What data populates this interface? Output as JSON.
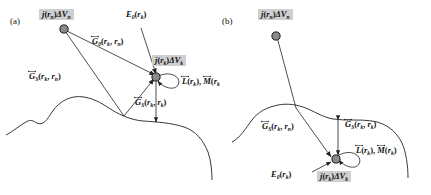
{
  "figure": {
    "type": "two-panel scientific diagram",
    "colors": {
      "stroke": "#222222",
      "node_fill": "#8a8a8a",
      "node_stroke": "#1a1a1a",
      "label_highlight": "#cfcfcf",
      "background": "#ffffff"
    }
  },
  "panel_a": {
    "id": "(a)",
    "labels": {
      "source": {
        "sym": "j",
        "arg": "r",
        "arg_sub": "n",
        "delta": "ΔV",
        "delta_sub": "n",
        "highlight": true
      },
      "field_point": {
        "sym": "j",
        "arg": "r",
        "arg_sub": "k",
        "delta": "ΔV",
        "delta_sub": "k",
        "highlight": true
      },
      "incident": {
        "sym": "E",
        "sym_sub": "0",
        "arg": "r",
        "arg_sub": "k"
      },
      "g0": {
        "sym": "G",
        "sym_sub": "0",
        "a1": "r",
        "a1_sub": "k",
        "a2": "r",
        "a2_sub": "n",
        "tensor": true
      },
      "gs_kn": {
        "sym": "G",
        "sym_sub": "S",
        "a1": "r",
        "a1_sub": "k",
        "a2": "r",
        "a2_sub": "n",
        "tensor": true
      },
      "gs_kk": {
        "sym": "G",
        "sym_sub": "S",
        "a1": "r",
        "a1_sub": "k",
        "a2": "r",
        "a2_sub": "k",
        "tensor": true
      },
      "lm": {
        "l": "L",
        "m": "M",
        "arg": "r",
        "arg_sub": "k",
        "sep": ", ",
        "tensor": true
      }
    }
  },
  "panel_b": {
    "id": "(b)",
    "labels": {
      "source": {
        "sym": "j",
        "arg": "r",
        "arg_sub": "n",
        "delta": "ΔV",
        "delta_sub": "n",
        "highlight": true
      },
      "field_point": {
        "sym": "j",
        "arg": "r",
        "arg_sub": "k",
        "delta": "ΔV",
        "delta_sub": "k",
        "highlight": true
      },
      "incident": {
        "sym": "E",
        "sym_sub": "0",
        "arg": "r",
        "arg_sub": "k"
      },
      "gs_kn": {
        "sym": "G",
        "sym_sub": "S",
        "a1": "r",
        "a1_sub": "k",
        "a2": "r",
        "a2_sub": "n",
        "tensor": true
      },
      "gs_kk": {
        "sym": "G",
        "sym_sub": "S",
        "a1": "r",
        "a1_sub": "k",
        "a2": "r",
        "a2_sub": "k",
        "tensor": true
      },
      "lm": {
        "l": "L",
        "m": "M",
        "arg": "r",
        "arg_sub": "k",
        "sep": ", ",
        "tensor": true
      }
    }
  },
  "text": {
    "panel_a_id": "(a)",
    "panel_b_id": "(b)",
    "j": "j",
    "E": "E",
    "G": "G",
    "L": "L",
    "M": "M",
    "r": "r",
    "deltaV": "ΔV",
    "zero": "0",
    "S": "S",
    "n": "n",
    "k": "k",
    "lparen": "(",
    "rparen": ")",
    "comma": ", ",
    "comma_sep": ", "
  }
}
